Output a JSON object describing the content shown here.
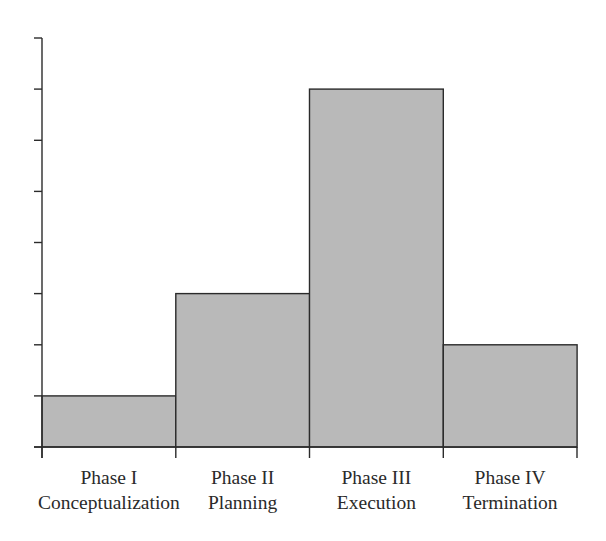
{
  "chart_data": {
    "type": "bar",
    "title": "",
    "xlabel": "",
    "ylabel": "",
    "categories": [
      "Phase I Conceptualization",
      "Phase II Planning",
      "Phase III Execution",
      "Phase IV Termination"
    ],
    "category_labels": [
      {
        "line1": "Phase I",
        "line2": "Conceptualization"
      },
      {
        "line1": "Phase II",
        "line2": "Planning"
      },
      {
        "line1": "Phase III",
        "line2": "Execution"
      },
      {
        "line1": "Phase IV",
        "line2": "Termination"
      }
    ],
    "values": [
      1,
      3,
      7,
      2
    ],
    "ylim": [
      0,
      8
    ],
    "y_ticks": [
      0,
      1,
      2,
      3,
      4,
      5,
      6,
      7,
      8
    ],
    "y_tick_labels_visible": false,
    "grid": false,
    "legend": null,
    "bar_gap": 0,
    "colors": {
      "bar_fill": "#b9b9b9",
      "bar_stroke": "#2b2b2b",
      "axis": "#2b2b2b",
      "text": "#2a2a2a"
    }
  }
}
